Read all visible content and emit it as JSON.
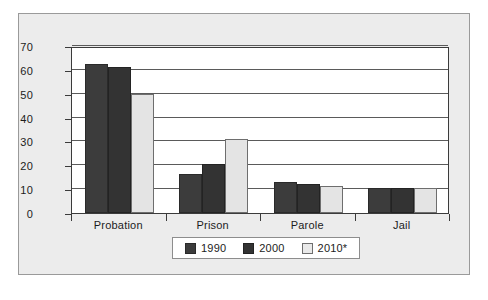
{
  "chart_data": {
    "type": "bar",
    "title": "",
    "subtitle": "",
    "xlabel": "",
    "ylabel": "",
    "categories": [
      "Probation",
      "Prison",
      "Parole",
      "Jail"
    ],
    "series": [
      {
        "name": "1990",
        "color": "#3c3c3c",
        "values": [
          62.5,
          16.5,
          13.0,
          10.5
        ]
      },
      {
        "name": "2000",
        "color": "#333333",
        "values": [
          61.0,
          20.5,
          12.0,
          10.5
        ]
      },
      {
        "name": "2010*",
        "color": "#e4e4e4",
        "values": [
          50.0,
          31.0,
          11.5,
          10.5
        ]
      }
    ],
    "ylim": [
      0,
      70
    ],
    "yticks": [
      0,
      10,
      20,
      30,
      40,
      50,
      60,
      70
    ],
    "ytick_labels": [
      "0",
      "10",
      "20",
      "30",
      "40",
      "50",
      "60",
      "70"
    ],
    "grid": true,
    "grid_axis": "y",
    "legend_position": "bottom-center"
  },
  "legend": {
    "entries": [
      {
        "label": "1990"
      },
      {
        "label": "2000"
      },
      {
        "label": "2010*"
      }
    ]
  }
}
